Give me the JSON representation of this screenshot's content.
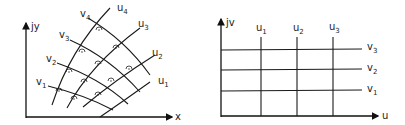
{
  "left_diagram": {
    "title": "curvilinear orthogonal grid in y-plane",
    "y_axis_label": "jy",
    "x_axis_label": "x",
    "u_curves": [
      {
        "name": "u",
        "sub": "1"
      },
      {
        "name": "u",
        "sub": "2"
      },
      {
        "name": "u",
        "sub": "3"
      },
      {
        "name": "u",
        "sub": "4"
      }
    ],
    "v_curves": [
      {
        "name": "v",
        "sub": "1"
      },
      {
        "name": "v",
        "sub": "2"
      },
      {
        "name": "v",
        "sub": "3"
      },
      {
        "name": "v",
        "sub": "4"
      }
    ],
    "right_angle_marker": "⊙ right-angle arc with dot at each intersection"
  },
  "right_diagram": {
    "title": "rectangular grid in v-plane",
    "y_axis_label": "jv",
    "x_axis_label": "u",
    "vertical_lines": [
      {
        "name": "u",
        "sub": "1"
      },
      {
        "name": "u",
        "sub": "2"
      },
      {
        "name": "u",
        "sub": "3"
      }
    ],
    "horizontal_lines": [
      {
        "name": "v",
        "sub": "3"
      },
      {
        "name": "v",
        "sub": "2"
      },
      {
        "name": "v",
        "sub": "1"
      }
    ]
  }
}
